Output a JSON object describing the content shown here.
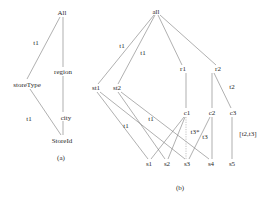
{
  "panel_a": {
    "caption": "(a)",
    "nodes": {
      "all": "All",
      "storeType": "storeType",
      "region": "region",
      "city": "city",
      "storeId": "StoreId"
    },
    "edge_labels": {
      "all_storeType": "t1",
      "storeType_storeId": "t1"
    }
  },
  "panel_b": {
    "caption": "(b)",
    "nodes": {
      "all": "all",
      "st1": "st1",
      "st2": "st2",
      "r1": "r1",
      "r2": "r2",
      "c1": "c1",
      "c2": "c2",
      "c3": "c3",
      "s1": "s1",
      "s2": "s2",
      "s3": "s3",
      "s4": "s4",
      "s5": "s5"
    },
    "edge_labels": {
      "all_st1": "t1",
      "all_st2": "t1",
      "r2_c3": "t2",
      "st1_s3": "t1",
      "st2_s4": "t1",
      "c1_s3": "t3*",
      "c2_s3": "t3",
      "c3_s5": "[t2,t3]"
    }
  }
}
